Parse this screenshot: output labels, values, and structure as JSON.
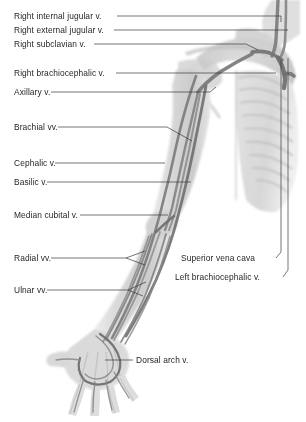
{
  "figure": {
    "background_color": "#ffffff",
    "ink_color": "#231f20",
    "tissue_light": "#e0e0e0",
    "tissue_mid": "#c4c4c4",
    "bone_gray": "#cfcfcf",
    "vein_dark": "#6f6f6f",
    "vein_mid": "#8f8f8f"
  },
  "labels": [
    {
      "id": "right-internal-jugular-v",
      "text": "Right internal jugular v.",
      "side": "left",
      "text_x": 14,
      "text_y": 12,
      "leader": "M 117 16 L 281 16 L 281 22"
    },
    {
      "id": "right-external-jugular-v",
      "text": "Right external jugular v.",
      "side": "left",
      "text_x": 14,
      "text_y": 26,
      "leader": "M 114 30 L 288 30"
    },
    {
      "id": "right-subclavian-v",
      "text": "Right subclavian v.",
      "side": "left",
      "text_x": 14,
      "text_y": 40,
      "leader": "M 94 44 L 246 44 L 258 50"
    },
    {
      "id": "right-brachiocephalic-v",
      "text": "Right brachiocephalic v.",
      "side": "left",
      "text_x": 14,
      "text_y": 69,
      "leader": "M 116 73 L 276 73"
    },
    {
      "id": "axillary-v",
      "text": "Axillary v.",
      "side": "left",
      "text_x": 14,
      "text_y": 88,
      "leader": "M 51 92 L 210 92 L 216 87"
    },
    {
      "id": "brachial-vv",
      "text": "Brachial vv.",
      "side": "left",
      "text_x": 14,
      "text_y": 123,
      "leader": "M 58 127 L 167 127 M 167 127 L 192 141"
    },
    {
      "id": "cephalic-v",
      "text": "Cephalic v.",
      "side": "left",
      "text_x": 14,
      "text_y": 159,
      "leader": "M 55 163 L 165 163"
    },
    {
      "id": "basilic-v",
      "text": "Basilic v.",
      "side": "left",
      "text_x": 14,
      "text_y": 178,
      "leader": "M 47 182 L 191 182"
    },
    {
      "id": "median-cubital-v",
      "text": "Median cubital v.",
      "side": "left",
      "text_x": 14,
      "text_y": 211,
      "leader": "M 80 215 L 168 215"
    },
    {
      "id": "radial-vv",
      "text": "Radial vv.",
      "side": "left",
      "text_x": 14,
      "text_y": 254,
      "leader": "M 51 258 L 126 258 M 126 258 L 145 251 M 126 258 L 145 265"
    },
    {
      "id": "ulnar-vv",
      "text": "Ulnar vv.",
      "side": "left",
      "text_x": 14,
      "text_y": 286,
      "leader": "M 47 290 L 128 290 M 128 290 L 146 282 M 128 290 L 143 296"
    },
    {
      "id": "superior-vena-cava",
      "text": "Superior vena cava",
      "side": "right",
      "text_x": 181,
      "text_y": 254,
      "leader": "M 276 258 L 281 252 L 281 60"
    },
    {
      "id": "left-brachiocephalic-v",
      "text": "Left brachiocephalic v.",
      "side": "right",
      "text_x": 175,
      "text_y": 273,
      "leader": "M 283 277 L 288 270 L 288 58"
    },
    {
      "id": "dorsal-arch-v",
      "text": "Dorsal arch v.",
      "side": "left",
      "text_x": 136,
      "text_y": 356,
      "leader": "M 133 360 L 105 360"
    }
  ]
}
